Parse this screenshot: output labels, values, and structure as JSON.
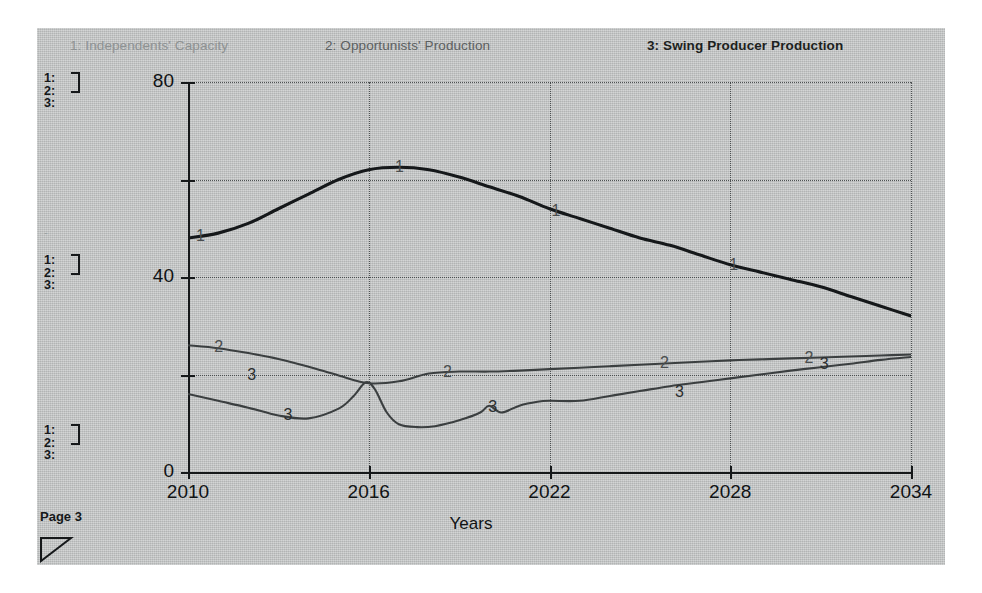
{
  "page": {
    "page_label": "Page 3",
    "corner_icon": "triangle-resize-handle-icon"
  },
  "legend": {
    "items": [
      {
        "id": "1",
        "label": "1: Independents' Capacity",
        "color": "#8e9293"
      },
      {
        "id": "2",
        "label": "2: Opportunists' Production",
        "color": "#5c6061"
      },
      {
        "id": "3",
        "label": "3: Swing Producer Production",
        "color": "#1d1f20"
      }
    ]
  },
  "key_blocks": [
    {
      "rows": [
        "1:",
        "2:",
        "3:"
      ]
    },
    {
      "rows": [
        "1:",
        "2:",
        "3:"
      ]
    },
    {
      "rows": [
        "1:",
        "2:",
        "3:"
      ]
    }
  ],
  "chart_data": {
    "type": "line",
    "title": "",
    "xlabel": "Years",
    "ylabel": "",
    "xlim": [
      2010,
      2034
    ],
    "ylim": [
      0,
      80
    ],
    "xticks": [
      2010,
      2016,
      2022,
      2028,
      2034
    ],
    "yticks": [
      0,
      20,
      40,
      60,
      80
    ],
    "ytick_labels": [
      "0",
      "",
      "40",
      "",
      "80"
    ],
    "grid": "dotted",
    "legend_position": "top",
    "series": [
      {
        "name": "1: Independents' Capacity",
        "marker_label": "1",
        "color": "#15181a",
        "width": 3.1,
        "x": [
          2010,
          2011,
          2012,
          2013,
          2014,
          2015,
          2016,
          2017,
          2018,
          2019,
          2020,
          2021,
          2022,
          2023,
          2024,
          2025,
          2026,
          2027,
          2028,
          2029,
          2030,
          2031,
          2032,
          2033,
          2034
        ],
        "y": [
          48,
          49,
          51,
          54,
          57,
          60,
          62,
          62.5,
          62,
          60.5,
          58.5,
          56.5,
          54,
          52,
          50,
          48,
          46.5,
          44.5,
          42.5,
          41,
          39.5,
          38,
          36,
          34,
          32
        ],
        "label_points": [
          [
            2010.4,
            48.5
          ],
          [
            2017.0,
            62.6
          ],
          [
            2022.2,
            53.5
          ],
          [
            2028.1,
            42.4
          ]
        ]
      },
      {
        "name": "2: Opportunists' Production",
        "marker_label": "2",
        "color": "#3b3f40",
        "width": 2.1,
        "x": [
          2010,
          2011,
          2012,
          2013,
          2014,
          2015,
          2016,
          2017,
          2018,
          2019,
          2020,
          2021,
          2022,
          2023,
          2024,
          2025,
          2026,
          2027,
          2028,
          2029,
          2030,
          2031,
          2032,
          2033,
          2034
        ],
        "y": [
          26,
          25.4,
          24.4,
          23.2,
          21.6,
          19.8,
          18.2,
          18.6,
          20.2,
          20.6,
          20.6,
          20.8,
          21.1,
          21.4,
          21.7,
          22.0,
          22.3,
          22.6,
          22.9,
          23.1,
          23.3,
          23.5,
          23.7,
          23.9,
          24.1
        ],
        "label_points": [
          [
            2011.0,
            25.6
          ],
          [
            2018.6,
            20.6
          ],
          [
            2025.8,
            22.4
          ],
          [
            2030.6,
            23.4
          ]
        ]
      },
      {
        "name": "3: Swing Producer Production",
        "marker_label": "3",
        "color": "#3b3f40",
        "width": 2.1,
        "x": [
          2010,
          2011,
          2012,
          2013,
          2014,
          2015,
          2015.5,
          2015.9,
          2016.2,
          2016.6,
          2017,
          2017.6,
          2018.2,
          2019,
          2019.7,
          2020,
          2020.4,
          2021,
          2021.6,
          2022,
          2023,
          2024,
          2025,
          2026,
          2027,
          2028,
          2029,
          2030,
          2031,
          2032,
          2033,
          2034
        ],
        "y": [
          16,
          14.6,
          13.2,
          11.6,
          11.0,
          13.0,
          15.6,
          18.4,
          17.0,
          12.2,
          9.8,
          9.2,
          9.4,
          10.6,
          12.2,
          13.6,
          12.2,
          13.6,
          14.4,
          14.6,
          14.6,
          15.6,
          16.6,
          17.6,
          18.4,
          19.2,
          20.0,
          20.8,
          21.5,
          22.2,
          23.0,
          23.6
        ],
        "label_points": [
          [
            2013.3,
            11.6
          ],
          [
            2012.1,
            19.8
          ],
          [
            2020.1,
            13.3
          ],
          [
            2026.3,
            16.4
          ],
          [
            2031.1,
            22.2
          ]
        ]
      }
    ]
  }
}
